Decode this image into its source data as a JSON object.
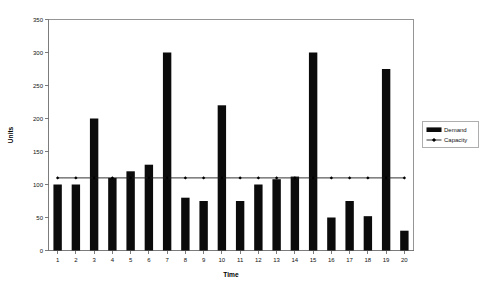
{
  "chart_data": {
    "type": "bar",
    "title": "",
    "subtitle": "",
    "xlabel": "Time",
    "ylabel": "Units",
    "categories": [
      "1",
      "2",
      "3",
      "4",
      "5",
      "6",
      "7",
      "8",
      "9",
      "10",
      "11",
      "12",
      "13",
      "14",
      "15",
      "16",
      "17",
      "18",
      "19",
      "20"
    ],
    "ylim": [
      0,
      350
    ],
    "yticks": [
      0,
      50,
      100,
      150,
      200,
      250,
      300,
      350
    ],
    "ytick_labels": [
      "0",
      "50",
      "100",
      "150",
      "200",
      "250",
      "300",
      "350"
    ],
    "grid": false,
    "legend_position": "right",
    "series": [
      {
        "name": "Demand",
        "type": "bar",
        "color": "#0b0b0b",
        "values": [
          100,
          100,
          200,
          110,
          120,
          130,
          300,
          80,
          75,
          220,
          75,
          100,
          108,
          112,
          300,
          50,
          75,
          52,
          275,
          30
        ]
      },
      {
        "name": "Capacity",
        "type": "line",
        "color": "#1a1a1a",
        "marker": "diamond",
        "values": [
          110,
          110,
          110,
          110,
          110,
          110,
          110,
          110,
          110,
          110,
          110,
          110,
          110,
          110,
          110,
          110,
          110,
          110,
          110,
          110
        ]
      }
    ]
  },
  "legend": {
    "entries": [
      {
        "label": "Demand",
        "swatch": "bar"
      },
      {
        "label": "Capacity",
        "swatch": "line-marker"
      }
    ]
  }
}
